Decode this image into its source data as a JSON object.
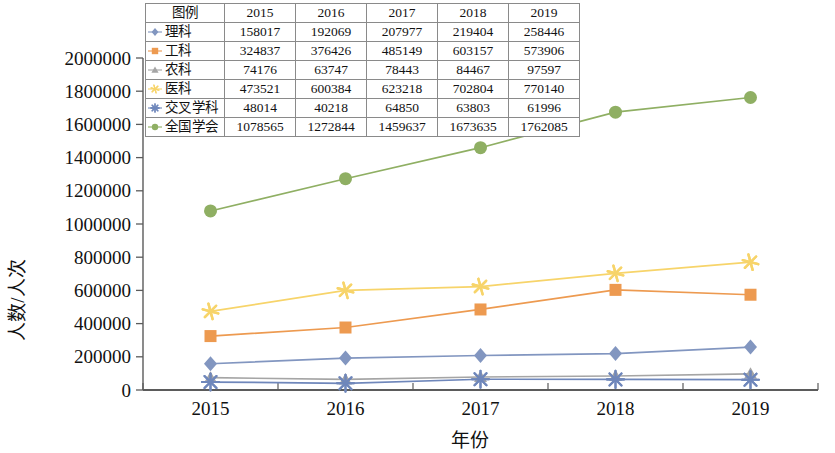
{
  "chart_data": {
    "type": "line",
    "title": "",
    "xlabel": "年份",
    "ylabel": "人数/人次",
    "categories": [
      "2015",
      "2016",
      "2017",
      "2018",
      "2019"
    ],
    "x": [
      2015,
      2016,
      2017,
      2018,
      2019
    ],
    "ylim": [
      0,
      2000000
    ],
    "ytick_step": 200000,
    "yticks": [
      "0",
      "200000",
      "400000",
      "600000",
      "800000",
      "1000000",
      "1200000",
      "1400000",
      "1600000",
      "1800000",
      "2000000"
    ],
    "grid": false,
    "legend_position": "top-inside-table",
    "legend_header": "图例",
    "series": [
      {
        "name": "理科",
        "color": "#8296c0",
        "marker": "diamond",
        "values": [
          158017,
          192069,
          207977,
          219404,
          258446
        ]
      },
      {
        "name": "工科",
        "color": "#ed9a50",
        "marker": "square",
        "values": [
          324837,
          376426,
          485149,
          603157,
          573906
        ]
      },
      {
        "name": "农科",
        "color": "#a5a5a5",
        "marker": "triangle",
        "values": [
          74176,
          63747,
          78443,
          84467,
          97597
        ]
      },
      {
        "name": "医科",
        "color": "#f7d46a",
        "marker": "star",
        "values": [
          473521,
          600384,
          623218,
          702804,
          770140
        ]
      },
      {
        "name": "交叉学科",
        "color": "#6f87bb",
        "marker": "starburst",
        "values": [
          48014,
          40218,
          64850,
          63803,
          61996
        ]
      },
      {
        "name": "全国学会",
        "color": "#8faf63",
        "marker": "circle",
        "values": [
          1078565,
          1272844,
          1459637,
          1673635,
          1762085
        ]
      }
    ]
  },
  "legend_table": {
    "header": [
      "图例",
      "2015",
      "2016",
      "2017",
      "2018",
      "2019"
    ],
    "rows": [
      {
        "name": "理科",
        "values": [
          "158017",
          "192069",
          "207977",
          "219404",
          "258446"
        ]
      },
      {
        "name": "工科",
        "values": [
          "324837",
          "376426",
          "485149",
          "603157",
          "573906"
        ]
      },
      {
        "name": "农科",
        "values": [
          "74176",
          "63747",
          "78443",
          "84467",
          "97597"
        ]
      },
      {
        "name": "医科",
        "values": [
          "473521",
          "600384",
          "623218",
          "702804",
          "770140"
        ]
      },
      {
        "name": "交叉学科",
        "values": [
          "48014",
          "40218",
          "64850",
          "63803",
          "61996"
        ]
      },
      {
        "name": "全国学会",
        "values": [
          "1078565",
          "1272844",
          "1459637",
          "1673635",
          "1762085"
        ]
      }
    ]
  },
  "axes": {
    "y_label": "人数/人次",
    "x_label": "年份",
    "y_ticks": [
      "2000000",
      "1800000",
      "1600000",
      "1400000",
      "1200000",
      "1000000",
      "800000",
      "600000",
      "400000",
      "200000",
      "0"
    ],
    "x_ticks": [
      "2015",
      "2016",
      "2017",
      "2018",
      "2019"
    ]
  }
}
